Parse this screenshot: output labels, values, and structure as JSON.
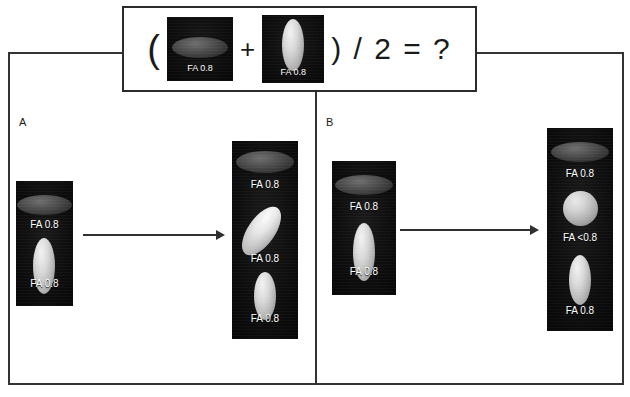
{
  "figure": {
    "background_color": "#ffffff",
    "frame_color": "#333333",
    "tile_color": "#0d0d0d",
    "label_color": "#ffffff"
  },
  "equation_box": {
    "open_paren": "(",
    "plus": "+",
    "tail": ") / 2 = ?",
    "operand_left": {
      "label": "FA 0.8",
      "shape": "horizontal-disc",
      "description": "dark oblate disc, in-plane orientation"
    },
    "operand_right": {
      "label": "FA 0.8",
      "shape": "vertical-ellipsoid",
      "description": "bright prolate ellipsoid, through-plane orientation"
    }
  },
  "panels": [
    {
      "letter": "A",
      "input": {
        "elements": [
          {
            "label": "FA 0.8",
            "shape": "horizontal-disc"
          },
          {
            "label": "FA 0.8",
            "shape": "vertical-ellipsoid"
          }
        ]
      },
      "arrow": {
        "name": "transform-arrow",
        "direction": "right"
      },
      "output": {
        "elements": [
          {
            "label": "FA 0.8",
            "shape": "horizontal-disc"
          },
          {
            "label": "FA 0.8",
            "shape": "tilted-ellipsoid"
          },
          {
            "label": "FA 0.8",
            "shape": "vertical-ellipsoid"
          }
        ]
      }
    },
    {
      "letter": "B",
      "input": {
        "elements": [
          {
            "label": "FA 0.8",
            "shape": "horizontal-disc"
          },
          {
            "label": "FA 0.8",
            "shape": "vertical-ellipsoid"
          }
        ]
      },
      "arrow": {
        "name": "transform-arrow",
        "direction": "right"
      },
      "output": {
        "elements": [
          {
            "label": "FA 0.8",
            "shape": "horizontal-disc"
          },
          {
            "label": "FA <0.8",
            "shape": "sphere"
          },
          {
            "label": "FA 0.8",
            "shape": "vertical-ellipsoid"
          }
        ]
      }
    }
  ]
}
